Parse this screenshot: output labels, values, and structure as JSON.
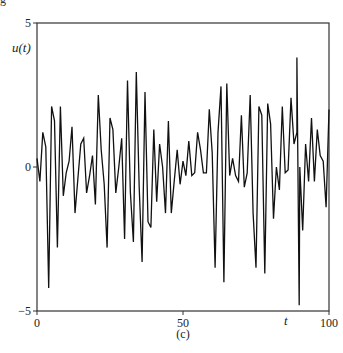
{
  "corner_fragment": "g",
  "chart_data": {
    "type": "line",
    "title": "",
    "caption": "(c)",
    "xlabel": "t",
    "ylabel": "u(t)",
    "xlim": [
      0,
      100
    ],
    "ylim": [
      -5,
      5
    ],
    "xticks": [
      0,
      50,
      100
    ],
    "xtick_labels": [
      "0",
      "50",
      "100"
    ],
    "yticks": [
      -5,
      0,
      5
    ],
    "ytick_labels": [
      "−5",
      "0",
      "5"
    ],
    "grid": false,
    "legend": null,
    "line_color": "#111111",
    "series": [
      {
        "name": "u(t)",
        "x": [
          0,
          1,
          2,
          3,
          4,
          5,
          6,
          7,
          8,
          9,
          10,
          11,
          12,
          13,
          14,
          15,
          16,
          17,
          18,
          19,
          20,
          21,
          22,
          23,
          24,
          25,
          26,
          27,
          28,
          29,
          30,
          31,
          32,
          33,
          34,
          35,
          36,
          37,
          38,
          39,
          40,
          41,
          42,
          43,
          44,
          45,
          46,
          47,
          48,
          49,
          50,
          51,
          52,
          53,
          54,
          55,
          56,
          57,
          58,
          59,
          60,
          61,
          62,
          63,
          64,
          65,
          66,
          67,
          68,
          69,
          70,
          71,
          72,
          73,
          74,
          75,
          76,
          77,
          78,
          79,
          80,
          81,
          82,
          83,
          84,
          85,
          86,
          87,
          88,
          89,
          90,
          91,
          92,
          93,
          94,
          95,
          96,
          97,
          98,
          99,
          100
        ],
        "values": [
          0.3,
          -0.5,
          1.2,
          0.7,
          -4.2,
          2.1,
          1.6,
          -2.8,
          2.1,
          -1.0,
          -0.2,
          0.2,
          1.4,
          -1.6,
          -0.4,
          0.8,
          1.0,
          -0.9,
          -0.3,
          0.4,
          -1.3,
          2.5,
          0.6,
          -0.6,
          -2.8,
          1.7,
          1.3,
          -0.9,
          0.0,
          1.0,
          -2.5,
          3.0,
          -0.9,
          -2.6,
          3.3,
          -0.7,
          -3.3,
          2.6,
          -1.9,
          -2.1,
          1.3,
          -1.2,
          0.8,
          0.0,
          -1.6,
          1.6,
          -1.6,
          -0.5,
          0.6,
          -0.6,
          0.2,
          -0.3,
          0.9,
          -0.3,
          -0.2,
          1.2,
          0.6,
          -0.2,
          -0.2,
          2.0,
          0.5,
          -3.5,
          1.2,
          2.8,
          -4.0,
          2.9,
          -0.3,
          0.3,
          -0.3,
          -0.5,
          1.8,
          -0.7,
          -0.2,
          2.5,
          -1.6,
          -3.5,
          2.1,
          1.8,
          -3.7,
          2.2,
          1.5,
          -1.8,
          0.0,
          -0.8,
          2.1,
          -0.2,
          -0.1,
          2.4,
          0.8,
          1.2,
          0.0,
          -2.2,
          0.8,
          -0.5,
          1.7,
          -0.5,
          1.3,
          0.4,
          0.2,
          -1.4,
          2.0
        ],
        "notable_extrema": {
          "max": {
            "t": 89,
            "u": 3.8
          },
          "min": {
            "t": 89.8,
            "u": -4.8
          }
        }
      }
    ]
  }
}
